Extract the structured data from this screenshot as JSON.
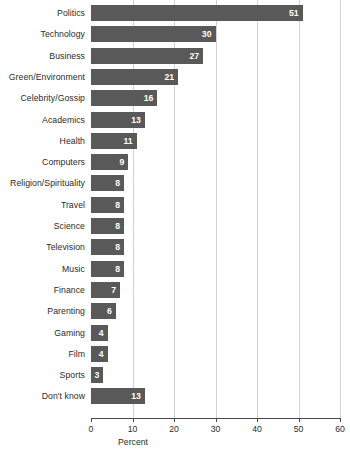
{
  "chart_data": {
    "type": "bar",
    "orientation": "horizontal",
    "title": "",
    "subtitle": "",
    "xlabel": "Percent",
    "ylabel": "",
    "xlim": [
      0,
      60
    ],
    "xticks": [
      0,
      10,
      20,
      30,
      40,
      50,
      60
    ],
    "grid": true,
    "legend": null,
    "bar_color": "#595959",
    "value_label_color": "#ffffff",
    "gridline_color": "#d2d2d2",
    "axis_color": "#4a4a4a",
    "categories": [
      "Politics",
      "Technology",
      "Business",
      "Green/Environment",
      "Celebrity/Gossip",
      "Academics",
      "Health",
      "Computers",
      "Religion/Spirituality",
      "Travel",
      "Science",
      "Television",
      "Music",
      "Finance",
      "Parenting",
      "Gaming",
      "Film",
      "Sports",
      "Don't know"
    ],
    "values": [
      51,
      30,
      27,
      21,
      16,
      13,
      11,
      9,
      8,
      8,
      8,
      8,
      8,
      7,
      6,
      4,
      4,
      3,
      13
    ],
    "value_labels": [
      "51",
      "30",
      "27",
      "21",
      "16",
      "13",
      "11",
      "9",
      "8",
      "8",
      "8",
      "8",
      "8",
      "7",
      "6",
      "4",
      "4",
      "3",
      "13"
    ],
    "xtick_labels": [
      "0",
      "10",
      "20",
      "30",
      "40",
      "50",
      "60"
    ]
  }
}
